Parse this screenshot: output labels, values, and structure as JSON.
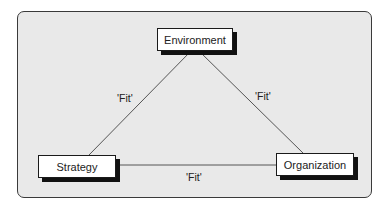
{
  "diagram": {
    "nodes": {
      "environment": {
        "label": "Environment"
      },
      "strategy": {
        "label": "Strategy"
      },
      "organization": {
        "label": "Organization"
      }
    },
    "edges": [
      {
        "from": "environment",
        "to": "strategy",
        "label": "'Fit'"
      },
      {
        "from": "environment",
        "to": "organization",
        "label": "'Fit'"
      },
      {
        "from": "strategy",
        "to": "organization",
        "label": "'Fit'"
      }
    ],
    "colors": {
      "background": "#e9e9e9",
      "border": "#1a1a1a",
      "line": "#555555"
    }
  }
}
